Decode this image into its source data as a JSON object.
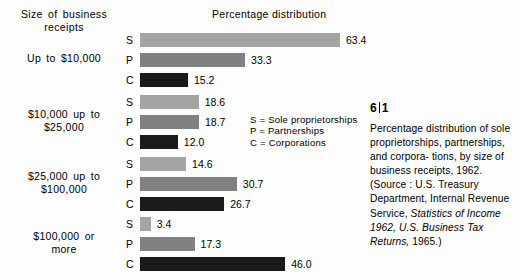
{
  "figure": {
    "number_major": "6",
    "number_minor": "1",
    "row_header": "Size of business receipts",
    "chart_title": "Percentage distribution"
  },
  "legend": [
    "S = Sole proprietorships",
    "P = Partnerships",
    "C = Corporations"
  ],
  "caption": {
    "line1": "Percentage distribution of",
    "line2": "sole proprietorships,",
    "line3": "partnerships, and corpora-",
    "line4": "tions, by size of business",
    "line5": "receipts, 1962.  (Source :",
    "line6": "U.S. Treasury Department,",
    "line7": "Internal Revenue Service,",
    "line8_italic": "Statistics of Income 1962,",
    "line9_italic": "U.S. Business Tax Returns,",
    "line10": "1965.)"
  },
  "colors": {
    "sole_proprietorships": "#a3a3a3",
    "partnerships": "#818181",
    "corporations": "#1a1a1a",
    "text": "#000000",
    "background": "#fdfdfd"
  },
  "chart_data": {
    "type": "bar",
    "title": "Percentage distribution",
    "xlabel": "Percentage distribution",
    "ylabel": "Size of business receipts",
    "xlim": [
      0,
      63.4
    ],
    "grid": false,
    "legend_position": "center-right",
    "orientation": "horizontal",
    "categories": [
      "Up to $10,000",
      "$10,000 up to $25,000",
      "$25,000 up to $100,000",
      "$100,000 or more"
    ],
    "series": [
      {
        "name": "S = Sole proprietorships",
        "key": "S",
        "values": [
          63.4,
          18.6,
          14.6,
          3.4
        ]
      },
      {
        "name": "P = Partnerships",
        "key": "P",
        "values": [
          33.3,
          18.7,
          30.7,
          17.3
        ]
      },
      {
        "name": "C = Corporations",
        "key": "C",
        "values": [
          15.2,
          12.0,
          26.7,
          46.0
        ]
      }
    ],
    "groups": [
      {
        "label_line1": "Up to $10,000",
        "label_line2": "",
        "bars": [
          {
            "key": "S",
            "value": 63.4,
            "value_label": "63.4"
          },
          {
            "key": "P",
            "value": 33.3,
            "value_label": "33.3"
          },
          {
            "key": "C",
            "value": 15.2,
            "value_label": "15.2"
          }
        ]
      },
      {
        "label_line1": "$10,000 up to",
        "label_line2": "$25,000",
        "bars": [
          {
            "key": "S",
            "value": 18.6,
            "value_label": "18.6"
          },
          {
            "key": "P",
            "value": 18.7,
            "value_label": "18.7"
          },
          {
            "key": "C",
            "value": 12.0,
            "value_label": "12.0"
          }
        ]
      },
      {
        "label_line1": "$25,000 up to",
        "label_line2": "$100,000",
        "bars": [
          {
            "key": "S",
            "value": 14.6,
            "value_label": "14.6"
          },
          {
            "key": "P",
            "value": 30.7,
            "value_label": "30.7"
          },
          {
            "key": "C",
            "value": 26.7,
            "value_label": "26.7"
          }
        ]
      },
      {
        "label_line1": "$100,000 or",
        "label_line2": "more",
        "bars": [
          {
            "key": "S",
            "value": 3.4,
            "value_label": "3.4"
          },
          {
            "key": "P",
            "value": 17.3,
            "value_label": "17.3"
          },
          {
            "key": "C",
            "value": 46.0,
            "value_label": "46.0"
          }
        ]
      }
    ]
  }
}
